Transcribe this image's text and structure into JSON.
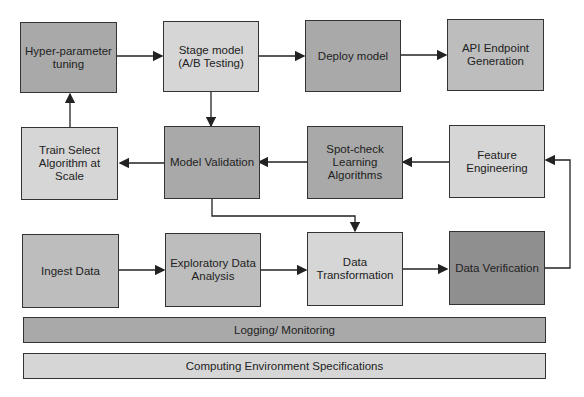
{
  "nodes": {
    "hyper": "Hyper-parameter tuning",
    "stage": "Stage model (A/B Testing)",
    "deploy": "Deploy model",
    "api": "API Endpoint Generation",
    "train": "Train Select Algorithm at Scale",
    "validation": "Model Validation",
    "spot": "Spot-check Learning Algorithms",
    "feature": "Feature Engineering",
    "ingest": "Ingest Data",
    "eda": "Exploratory Data Analysis",
    "transform": "Data Transformation",
    "verify": "Data Verification"
  },
  "bars": {
    "logging": "Logging/ Monitoring",
    "computing": "Computing Environment Specifications"
  },
  "colors": {
    "dark": "#a9a9a9",
    "light": "#d6d6d6",
    "darker": "#8f8f8f",
    "border": "#333333"
  }
}
